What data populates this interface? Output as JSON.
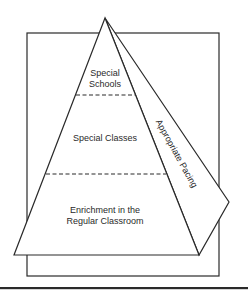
{
  "diagram": {
    "type": "pyramid",
    "tiers": [
      {
        "id": "top",
        "lines": [
          "Special",
          "Schools"
        ]
      },
      {
        "id": "middle",
        "lines": [
          "Special Classes"
        ]
      },
      {
        "id": "bottom",
        "lines": [
          "Enrichment in the",
          "Regular Classroom"
        ]
      }
    ],
    "side_face_label": "Appropriate Pacing",
    "colors": {
      "stroke": "#2a2a2a",
      "background": "#ffffff",
      "text": "#2a2a2a"
    }
  }
}
